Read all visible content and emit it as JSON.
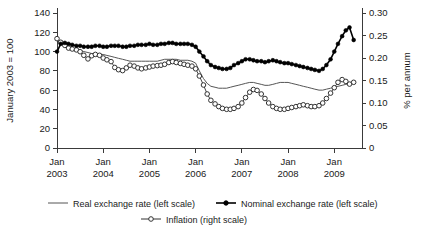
{
  "chart_data": {
    "type": "line",
    "title": "",
    "subtitle": "",
    "xlabel": "",
    "ylabel": "January 2003 = 100",
    "y2label": "% per annum",
    "grid": false,
    "legend_position": "bottom",
    "xlim": [
      2003.0,
      2009.6
    ],
    "ylim": [
      0,
      140
    ],
    "y2lim": [
      0,
      0.3
    ],
    "yticks": [
      0,
      20,
      40,
      60,
      80,
      100,
      120,
      140
    ],
    "ytick_labels": [
      "0",
      "20",
      "40",
      "60",
      "80",
      "100",
      "120",
      "140"
    ],
    "y2ticks": [
      0,
      0.05,
      0.1,
      0.15,
      0.2,
      0.25,
      0.3
    ],
    "y2tick_labels": [
      "0",
      "0.05",
      "0.10",
      "0.15",
      "0.20",
      "0.25",
      "0.30"
    ],
    "xticks": [
      2003,
      2004,
      2005,
      2006,
      2007,
      2008,
      2009
    ],
    "xtick_labels": [
      [
        "Jan",
        "2003"
      ],
      [
        "Jan",
        "2004"
      ],
      [
        "Jan",
        "2005"
      ],
      [
        "Jan",
        "2006"
      ],
      [
        "Jan",
        "2007"
      ],
      [
        "Jan",
        "2008"
      ],
      [
        "Jan",
        "2009"
      ]
    ],
    "legend": [
      {
        "label": "Real exchange rate (left scale)",
        "marker": "none",
        "color": "#555555"
      },
      {
        "label": "Nominal exchange rate (left scale)",
        "marker": "filled-circle",
        "color": "#000000"
      },
      {
        "label": "Inflation (right scale)",
        "marker": "open-circle",
        "color": "#333333"
      }
    ],
    "series": [
      {
        "name": "Real exchange rate (left scale)",
        "axis": "left",
        "marker": "none",
        "x": [
          2003.0,
          2003.08,
          2003.17,
          2003.25,
          2003.33,
          2003.42,
          2003.5,
          2003.58,
          2003.67,
          2003.75,
          2003.83,
          2003.92,
          2004.0,
          2004.08,
          2004.17,
          2004.25,
          2004.33,
          2004.42,
          2004.5,
          2004.58,
          2004.67,
          2004.75,
          2004.83,
          2004.92,
          2005.0,
          2005.08,
          2005.17,
          2005.25,
          2005.33,
          2005.42,
          2005.5,
          2005.58,
          2005.67,
          2005.75,
          2005.83,
          2005.92,
          2006.0,
          2006.08,
          2006.17,
          2006.25,
          2006.33,
          2006.42,
          2006.5,
          2006.58,
          2006.67,
          2006.75,
          2006.83,
          2006.92,
          2007.0,
          2007.08,
          2007.17,
          2007.25,
          2007.33,
          2007.42,
          2007.5,
          2007.58,
          2007.67,
          2007.75,
          2007.83,
          2007.92,
          2008.0,
          2008.08,
          2008.17,
          2008.25,
          2008.33,
          2008.42,
          2008.5,
          2008.58,
          2008.67,
          2008.75,
          2008.83,
          2008.92,
          2009.0,
          2009.08,
          2009.17,
          2009.25,
          2009.33,
          2009.42
        ],
        "values": [
          112,
          108,
          106,
          104,
          103,
          102,
          101,
          100,
          99,
          98,
          98,
          97,
          97,
          96,
          95,
          94,
          93,
          92,
          91,
          90,
          90,
          90,
          90,
          90,
          90,
          90,
          90,
          91,
          92,
          92,
          92,
          92,
          91,
          91,
          91,
          90,
          88,
          80,
          72,
          67,
          64,
          63,
          62,
          62,
          62,
          63,
          64,
          65,
          66,
          67,
          68,
          68,
          67,
          66,
          65,
          65,
          66,
          67,
          68,
          68,
          68,
          67,
          66,
          65,
          64,
          63,
          62,
          61,
          60,
          60,
          61,
          62,
          63,
          64,
          65,
          66,
          67,
          67
        ]
      },
      {
        "name": "Nominal exchange rate (left scale)",
        "axis": "left",
        "marker": "filled-circle",
        "x": [
          2003.0,
          2003.08,
          2003.17,
          2003.25,
          2003.33,
          2003.42,
          2003.5,
          2003.58,
          2003.67,
          2003.75,
          2003.83,
          2003.92,
          2004.0,
          2004.08,
          2004.17,
          2004.25,
          2004.33,
          2004.42,
          2004.5,
          2004.58,
          2004.67,
          2004.75,
          2004.83,
          2004.92,
          2005.0,
          2005.08,
          2005.17,
          2005.25,
          2005.33,
          2005.42,
          2005.5,
          2005.58,
          2005.67,
          2005.75,
          2005.83,
          2005.92,
          2006.0,
          2006.08,
          2006.17,
          2006.25,
          2006.33,
          2006.42,
          2006.5,
          2006.58,
          2006.67,
          2006.75,
          2006.83,
          2006.92,
          2007.0,
          2007.08,
          2007.17,
          2007.25,
          2007.33,
          2007.42,
          2007.5,
          2007.58,
          2007.67,
          2007.75,
          2007.83,
          2007.92,
          2008.0,
          2008.08,
          2008.17,
          2008.25,
          2008.33,
          2008.42,
          2008.5,
          2008.58,
          2008.67,
          2008.75,
          2008.83,
          2008.92,
          2009.0,
          2009.08,
          2009.17,
          2009.25,
          2009.33,
          2009.42
        ],
        "values": [
          100,
          108,
          109,
          108,
          107,
          106,
          106,
          105,
          105,
          105,
          106,
          106,
          105,
          105,
          106,
          106,
          106,
          105,
          105,
          106,
          106,
          107,
          107,
          107,
          108,
          107,
          107,
          108,
          108,
          109,
          109,
          108,
          108,
          108,
          108,
          107,
          105,
          100,
          95,
          90,
          86,
          84,
          83,
          82,
          82,
          83,
          86,
          88,
          90,
          92,
          92,
          91,
          90,
          90,
          89,
          90,
          91,
          90,
          89,
          88,
          88,
          87,
          86,
          85,
          84,
          83,
          82,
          81,
          80,
          82,
          86,
          92,
          100,
          108,
          116,
          122,
          125,
          112
        ]
      },
      {
        "name": "Inflation (right scale)",
        "axis": "right",
        "marker": "open-circle",
        "x": [
          2003.0,
          2003.08,
          2003.17,
          2003.25,
          2003.33,
          2003.42,
          2003.5,
          2003.58,
          2003.67,
          2003.75,
          2003.83,
          2003.92,
          2004.0,
          2004.08,
          2004.17,
          2004.25,
          2004.33,
          2004.42,
          2004.5,
          2004.58,
          2004.67,
          2004.75,
          2004.83,
          2004.92,
          2005.0,
          2005.08,
          2005.17,
          2005.25,
          2005.33,
          2005.42,
          2005.5,
          2005.58,
          2005.67,
          2005.75,
          2005.83,
          2005.92,
          2006.0,
          2006.08,
          2006.17,
          2006.25,
          2006.33,
          2006.42,
          2006.5,
          2006.58,
          2006.67,
          2006.75,
          2006.83,
          2006.92,
          2007.0,
          2007.08,
          2007.17,
          2007.25,
          2007.33,
          2007.42,
          2007.5,
          2007.58,
          2007.67,
          2007.75,
          2007.83,
          2007.92,
          2008.0,
          2008.08,
          2008.17,
          2008.25,
          2008.33,
          2008.42,
          2008.5,
          2008.58,
          2008.67,
          2008.75,
          2008.83,
          2008.92,
          2009.0,
          2009.08,
          2009.17,
          2009.25,
          2009.33,
          2009.42
        ],
        "values_right": [
          0.243,
          0.235,
          0.228,
          0.222,
          0.22,
          0.218,
          0.214,
          0.206,
          0.198,
          0.205,
          0.208,
          0.206,
          0.2,
          0.196,
          0.192,
          0.179,
          0.174,
          0.172,
          0.178,
          0.184,
          0.182,
          0.178,
          0.176,
          0.178,
          0.18,
          0.182,
          0.183,
          0.184,
          0.186,
          0.19,
          0.192,
          0.19,
          0.188,
          0.186,
          0.184,
          0.182,
          0.176,
          0.16,
          0.14,
          0.12,
          0.106,
          0.098,
          0.092,
          0.088,
          0.086,
          0.086,
          0.088,
          0.092,
          0.1,
          0.112,
          0.124,
          0.13,
          0.128,
          0.12,
          0.11,
          0.1,
          0.092,
          0.088,
          0.086,
          0.086,
          0.088,
          0.09,
          0.092,
          0.094,
          0.096,
          0.094,
          0.092,
          0.092,
          0.094,
          0.1,
          0.11,
          0.122,
          0.134,
          0.146,
          0.152,
          0.148,
          0.142,
          0.146
        ]
      }
    ]
  }
}
